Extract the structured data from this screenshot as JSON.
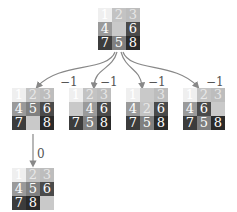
{
  "diagram": {
    "root": {
      "tiles": [
        1,
        2,
        3,
        4,
        0,
        6,
        7,
        5,
        8
      ],
      "x": 98,
      "y": 8
    },
    "children": [
      {
        "tiles": [
          1,
          2,
          3,
          4,
          5,
          6,
          7,
          0,
          8
        ],
        "x": 12,
        "y": 88,
        "edge_label": "−1",
        "label_x": 60,
        "label_y": 76
      },
      {
        "tiles": [
          1,
          2,
          3,
          0,
          4,
          6,
          7,
          5,
          8
        ],
        "x": 69,
        "y": 88,
        "edge_label": "−1",
        "label_x": 100,
        "label_y": 76
      },
      {
        "tiles": [
          1,
          0,
          3,
          4,
          2,
          6,
          7,
          5,
          8
        ],
        "x": 126,
        "y": 88,
        "edge_label": "−1",
        "label_x": 148,
        "label_y": 76
      },
      {
        "tiles": [
          1,
          2,
          3,
          4,
          6,
          0,
          7,
          5,
          8
        ],
        "x": 183,
        "y": 88,
        "edge_label": "−1",
        "label_x": 206,
        "label_y": 76
      }
    ],
    "grandchild": {
      "tiles": [
        1,
        2,
        3,
        4,
        5,
        6,
        7,
        8,
        0
      ],
      "x": 12,
      "y": 168,
      "edge_label": "0",
      "label_x": 37,
      "label_y": 148
    }
  }
}
